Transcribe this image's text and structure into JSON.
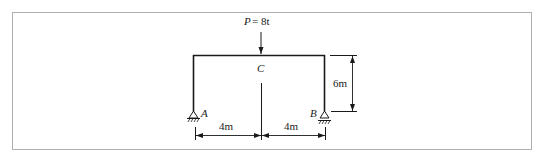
{
  "diagram": {
    "type": "portal-frame-structural",
    "load": {
      "symbol": "P",
      "eq": "= 8t",
      "label": "P= 8t",
      "direction": "down"
    },
    "points": {
      "A": "A",
      "B": "B",
      "C": "C"
    },
    "supports": {
      "A": "pin",
      "B": "roller"
    },
    "dimensions": {
      "left_span": "4m",
      "right_span": "4m",
      "height": "6m"
    },
    "colors": {
      "line": "#1a1a1a",
      "frame_border": "#b0b0b0",
      "background": "#ffffff"
    }
  }
}
